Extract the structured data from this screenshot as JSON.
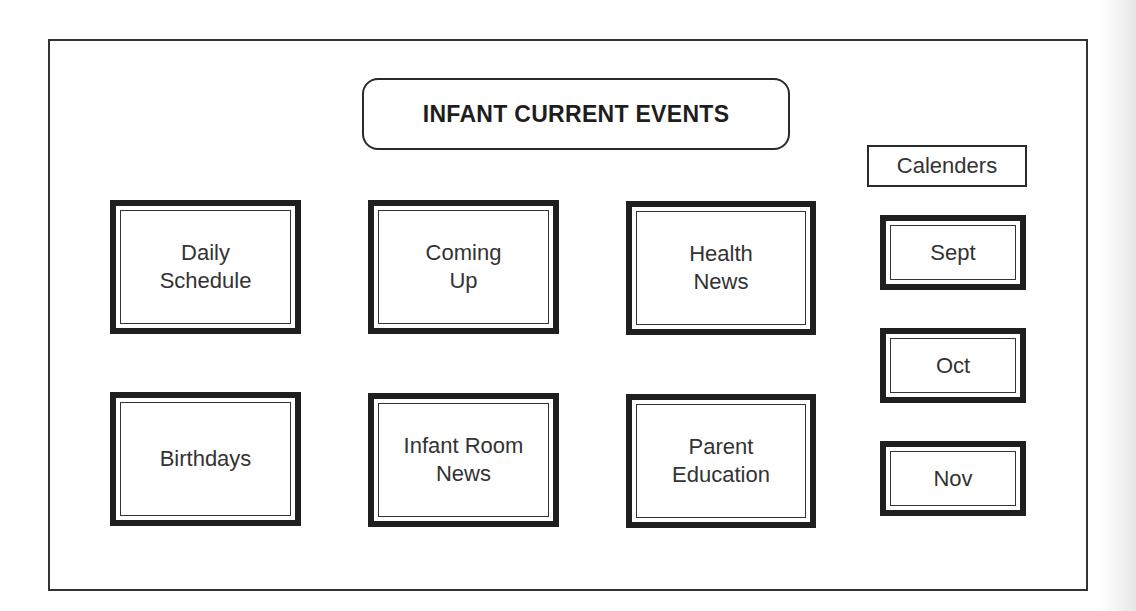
{
  "title": "INFANT CURRENT EVENTS",
  "sections": [
    {
      "id": "daily-schedule",
      "label": "Daily\nSchedule"
    },
    {
      "id": "coming-up",
      "label": "Coming\nUp"
    },
    {
      "id": "health-news",
      "label": "Health\nNews"
    },
    {
      "id": "birthdays",
      "label": "Birthdays"
    },
    {
      "id": "infant-room-news",
      "label": "Infant Room\nNews"
    },
    {
      "id": "parent-education",
      "label": "Parent\nEducation"
    }
  ],
  "calendars": {
    "heading": "Calenders",
    "months": [
      {
        "label": "Sept"
      },
      {
        "label": "Oct"
      },
      {
        "label": "Nov"
      }
    ]
  }
}
